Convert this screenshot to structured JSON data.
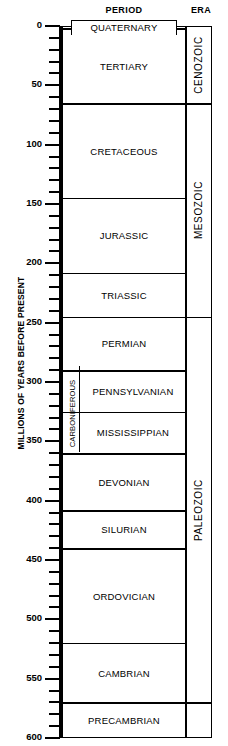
{
  "headers": {
    "period": "PERIOD",
    "era": "ERA"
  },
  "axis": {
    "title": "MILLIONS OF YEARS BEFORE PRESENT",
    "unit": "millions of years",
    "direction": "downward",
    "min": 0,
    "max": 600,
    "major_step": 50,
    "minor_step": 10,
    "tick_labels": [
      "0",
      "50",
      "100",
      "150",
      "200",
      "250",
      "300",
      "350",
      "400",
      "450",
      "500",
      "550",
      "600"
    ]
  },
  "chart_data": {
    "type": "table",
    "xlabel": "",
    "ylabel": "MILLIONS OF YEARS BEFORE PRESENT",
    "ylim": [
      0,
      600
    ],
    "grid": false,
    "legend": "none",
    "columns": [
      "PERIOD",
      "ERA"
    ],
    "eras": [
      {
        "name": "CENOZOIC",
        "start": 0,
        "end": 65
      },
      {
        "name": "MESOZOIC",
        "start": 65,
        "end": 245
      },
      {
        "name": "PALEOZOIC",
        "start": 245,
        "end": 570
      }
    ],
    "periods": [
      {
        "name": "QUATERNARY",
        "start": 0,
        "end": 2,
        "era": "CENOZOIC",
        "style": "tab"
      },
      {
        "name": "TERTIARY",
        "start": 2,
        "end": 65,
        "era": "CENOZOIC"
      },
      {
        "name": "CRETACEOUS",
        "start": 65,
        "end": 145,
        "era": "MESOZOIC"
      },
      {
        "name": "JURASSIC",
        "start": 145,
        "end": 208,
        "era": "MESOZOIC"
      },
      {
        "name": "TRIASSIC",
        "start": 208,
        "end": 245,
        "era": "MESOZOIC"
      },
      {
        "name": "PERMIAN",
        "start": 245,
        "end": 290,
        "era": "PALEOZOIC"
      },
      {
        "name": "PENNSYLVANIAN",
        "start": 290,
        "end": 325,
        "era": "PALEOZOIC",
        "parent": "CARBONIFEROUS"
      },
      {
        "name": "MISSISSIPPIAN",
        "start": 325,
        "end": 360,
        "era": "PALEOZOIC",
        "parent": "CARBONIFEROUS"
      },
      {
        "name": "DEVONIAN",
        "start": 360,
        "end": 408,
        "era": "PALEOZOIC"
      },
      {
        "name": "SILURIAN",
        "start": 408,
        "end": 440,
        "era": "PALEOZOIC"
      },
      {
        "name": "ORDOVICIAN",
        "start": 440,
        "end": 520,
        "era": "PALEOZOIC"
      },
      {
        "name": "CAMBRIAN",
        "start": 520,
        "end": 570,
        "era": "PALEOZOIC"
      },
      {
        "name": "PRECAMBRIAN",
        "start": 570,
        "end": 600,
        "era": ""
      }
    ],
    "super_periods": [
      {
        "name": "CARBONIFEROUS",
        "start": 290,
        "end": 360
      }
    ]
  }
}
